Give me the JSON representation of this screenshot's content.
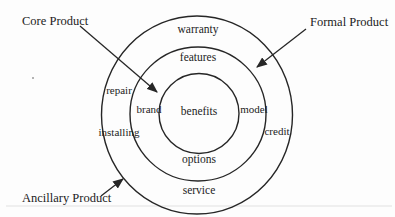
{
  "figure": {
    "type": "diagram",
    "callouts": {
      "core": {
        "label": "Core Product"
      },
      "formal": {
        "label": "Formal Product"
      },
      "ancillary": {
        "label": "Ancillary Product"
      }
    },
    "levels": {
      "core": {
        "benefits": "benefits"
      },
      "formal": {
        "features": "features",
        "brand": "brand",
        "model": "model",
        "options": "options"
      },
      "ancillary": {
        "warranty": "warranty",
        "repair": "repair",
        "installing": "installing",
        "credit": "credit",
        "service": "service"
      }
    },
    "colors": {
      "line": "#262626",
      "text": "#1c1c1c",
      "background": "#fdfdfd",
      "rule": "#d9d9d9"
    }
  }
}
